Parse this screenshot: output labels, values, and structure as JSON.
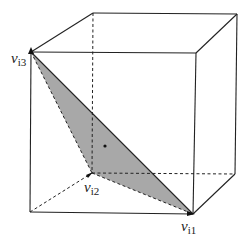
{
  "diagram": {
    "colors": {
      "edge": "#222222",
      "triangle_fill": "#a8a8a8",
      "background": "#ffffff"
    },
    "cube": {
      "front": {
        "tl": [
          31,
          52
        ],
        "tr": [
          196,
          53
        ],
        "br": [
          193,
          214
        ],
        "bl": [
          30,
          212
        ]
      },
      "back": {
        "tl": [
          93,
          13
        ],
        "tr": [
          237,
          14
        ],
        "br": [
          235,
          174
        ],
        "bl": [
          92,
          173
        ]
      },
      "hidden_edges": [
        "back-tl to back-bl",
        "back-bl to back-br",
        "front-bl to back-bl"
      ]
    },
    "triangle": {
      "vertices": {
        "v_i1": [
          193,
          214
        ],
        "v_i2": [
          92,
          173
        ],
        "v_i3": [
          31,
          52
        ]
      },
      "centroid_dot": [
        105,
        146
      ]
    },
    "labels": {
      "v_i1": {
        "main": "v",
        "sub": "i1"
      },
      "v_i2": {
        "main": "v",
        "sub": "i2"
      },
      "v_i3": {
        "main": "v",
        "sub": "i3"
      }
    }
  }
}
